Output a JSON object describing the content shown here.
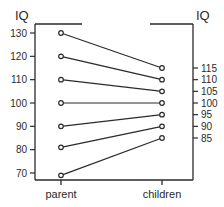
{
  "chart_data": {
    "type": "line",
    "title": "",
    "xlabel": "",
    "ylabel": "IQ",
    "y2label": "IQ",
    "categories": [
      "parent",
      "children"
    ],
    "left_axis": {
      "label": "IQ",
      "ticks": [
        130,
        120,
        110,
        100,
        90,
        80,
        70
      ],
      "range": [
        67,
        133
      ]
    },
    "right_axis": {
      "label": "IQ",
      "ticks": [
        115,
        110,
        105,
        100,
        95,
        90,
        85
      ]
    },
    "grid": false,
    "legend": null,
    "series": [
      {
        "name": "pair-1",
        "values": [
          130,
          115
        ]
      },
      {
        "name": "pair-2",
        "values": [
          120,
          110
        ]
      },
      {
        "name": "pair-3",
        "values": [
          110,
          105
        ]
      },
      {
        "name": "pair-4",
        "values": [
          100,
          100
        ]
      },
      {
        "name": "pair-5",
        "values": [
          90,
          95
        ]
      },
      {
        "name": "pair-6",
        "values": [
          81,
          90
        ]
      },
      {
        "name": "pair-7",
        "values": [
          69,
          85
        ]
      }
    ]
  },
  "labels": {
    "left_axis_title": "IQ",
    "right_axis_title": "IQ",
    "x_left": "parent",
    "x_right": "children"
  },
  "colors": {
    "ink": "#2a2a2a",
    "background": "#ffffff"
  }
}
